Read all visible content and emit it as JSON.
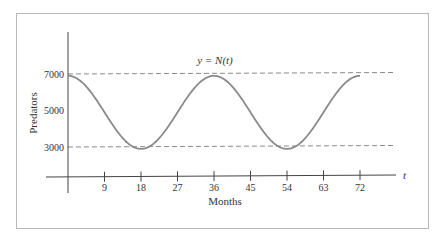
{
  "chart_data": {
    "type": "line",
    "title": "",
    "annotation": "y = N(t)",
    "xlabel": "Months",
    "ylabel": "Predators",
    "x_axis_variable": "t",
    "xticks": [
      9,
      18,
      27,
      36,
      45,
      54,
      63,
      72
    ],
    "yticks": [
      3000,
      5000,
      7000
    ],
    "xlim": [
      0,
      80
    ],
    "ylim": [
      0,
      9000
    ],
    "grid": false,
    "reference_lines": [
      {
        "y": 7000,
        "style": "dashed"
      },
      {
        "y": 3000,
        "style": "dashed"
      }
    ],
    "series": [
      {
        "name": "N(t)",
        "x": [
          0,
          4.5,
          9,
          13.5,
          18,
          22.5,
          27,
          31.5,
          36,
          40.5,
          45,
          49.5,
          54,
          58.5,
          63,
          67.5,
          72
        ],
        "values": [
          6900,
          6314,
          4900,
          3486,
          2900,
          3486,
          4900,
          6314,
          6900,
          6314,
          4900,
          3486,
          2900,
          3486,
          4900,
          6314,
          6900
        ]
      }
    ],
    "model": {
      "mean": 4900,
      "amplitude": 2000,
      "period": 36
    }
  },
  "colors": {
    "curve": "#8a8a8a",
    "axis": "#444444",
    "dashed": "#8a8a8a",
    "frame": "#b8b8b8"
  }
}
